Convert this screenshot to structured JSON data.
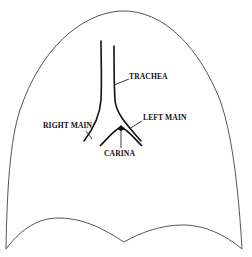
{
  "diagram": {
    "type": "anatomical-line-drawing",
    "labels": {
      "trachea": "TRACHEA",
      "left_main": "LEFT MAIN",
      "right_main": "RIGHT MAIN",
      "carina": "CARINA"
    },
    "colors": {
      "background": "#ffffff",
      "outline": "#555555",
      "airway": "#111111",
      "text": "#111111"
    }
  }
}
